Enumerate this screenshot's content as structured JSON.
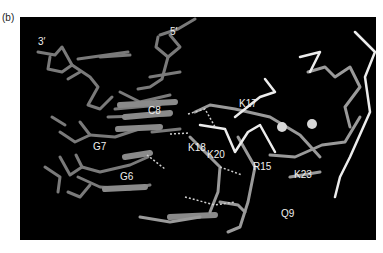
{
  "panel": {
    "letter": "(b)"
  },
  "figure": {
    "background": "#000000",
    "dna_color": "#7a7a7a",
    "protein_color": "#9a9a9a",
    "highlight_color": "#f2f2f2",
    "ion_color": "#d8d8d8",
    "labels": {
      "three_prime": "3′",
      "five_prime": "5′",
      "c8": "C8",
      "g7": "G7",
      "g6": "G6",
      "k17": "K17",
      "k18": "K18",
      "k20": "K20",
      "r15": "R15",
      "k23": "K23",
      "q9": "Q9"
    }
  }
}
